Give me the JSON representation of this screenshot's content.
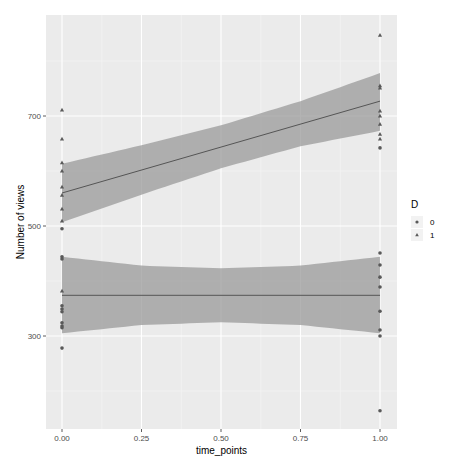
{
  "chart_data": {
    "type": "scatter",
    "title": "",
    "xlabel": "time_points",
    "ylabel": "Number of views",
    "xlim": [
      -0.05,
      1.05
    ],
    "ylim": [
      125,
      880
    ],
    "x_ticks": [
      0.0,
      0.25,
      0.5,
      0.75,
      1.0
    ],
    "x_tick_labels": [
      "0.00",
      "0.25",
      "0.50",
      "0.75",
      "1.00"
    ],
    "y_ticks": [
      300,
      500,
      700
    ],
    "y_tick_labels": [
      "300",
      "500",
      "700"
    ],
    "grid": true,
    "legend": {
      "title": "D",
      "position": "right",
      "entries": [
        {
          "label": "0",
          "shape": "circle"
        },
        {
          "label": "1",
          "shape": "triangle"
        }
      ]
    },
    "series": [
      {
        "name": "0",
        "shape": "circle",
        "points": [
          {
            "x": 0,
            "y": 495
          },
          {
            "x": 0,
            "y": 444
          },
          {
            "x": 0,
            "y": 440
          },
          {
            "x": 0,
            "y": 355
          },
          {
            "x": 0,
            "y": 349
          },
          {
            "x": 0,
            "y": 344
          },
          {
            "x": 0,
            "y": 324
          },
          {
            "x": 0,
            "y": 318
          },
          {
            "x": 0,
            "y": 315
          },
          {
            "x": 0,
            "y": 278
          },
          {
            "x": 1,
            "y": 642
          },
          {
            "x": 1,
            "y": 451
          },
          {
            "x": 1,
            "y": 429
          },
          {
            "x": 1,
            "y": 407
          },
          {
            "x": 1,
            "y": 389
          },
          {
            "x": 1,
            "y": 345
          },
          {
            "x": 1,
            "y": 311
          },
          {
            "x": 1,
            "y": 300
          },
          {
            "x": 1,
            "y": 164
          }
        ],
        "fit": {
          "method": "lm",
          "x": [
            0,
            0.25,
            0.5,
            0.75,
            1
          ],
          "y": [
            374,
            374,
            374,
            374,
            374
          ],
          "ymin": [
            305,
            320,
            325,
            320,
            305
          ],
          "ymax": [
            444,
            428,
            423,
            428,
            444
          ]
        }
      },
      {
        "name": "1",
        "shape": "triangle",
        "points": [
          {
            "x": 0,
            "y": 711
          },
          {
            "x": 0,
            "y": 658
          },
          {
            "x": 0,
            "y": 615
          },
          {
            "x": 0,
            "y": 600
          },
          {
            "x": 0,
            "y": 571
          },
          {
            "x": 0,
            "y": 556
          },
          {
            "x": 0,
            "y": 531
          },
          {
            "x": 0,
            "y": 509
          },
          {
            "x": 0,
            "y": 382
          },
          {
            "x": 1,
            "y": 847
          },
          {
            "x": 1,
            "y": 755
          },
          {
            "x": 1,
            "y": 751
          },
          {
            "x": 1,
            "y": 709
          },
          {
            "x": 1,
            "y": 700
          },
          {
            "x": 1,
            "y": 685
          },
          {
            "x": 1,
            "y": 667
          },
          {
            "x": 1,
            "y": 658
          }
        ],
        "fit": {
          "method": "lm",
          "x": [
            0,
            0.25,
            0.5,
            0.75,
            1
          ],
          "y": [
            560,
            602,
            644,
            686,
            727
          ],
          "ymin": [
            507,
            557,
            605,
            645,
            673
          ],
          "ymax": [
            613,
            647,
            683,
            727,
            778
          ]
        }
      }
    ]
  },
  "colors": {
    "panel_bg": "#ebebeb",
    "grid_major": "#ffffff",
    "grid_minor": "#f5f5f5",
    "point": "#595959",
    "fit_line": "#555555",
    "ribbon": "#999999"
  },
  "layout": {
    "panel": {
      "left": 46,
      "top": 15,
      "right": 397,
      "bottom": 429
    },
    "x_px": {
      "at0": 62,
      "at1": 380
    },
    "y_px": {
      "v300": 336,
      "v700": 116
    }
  }
}
